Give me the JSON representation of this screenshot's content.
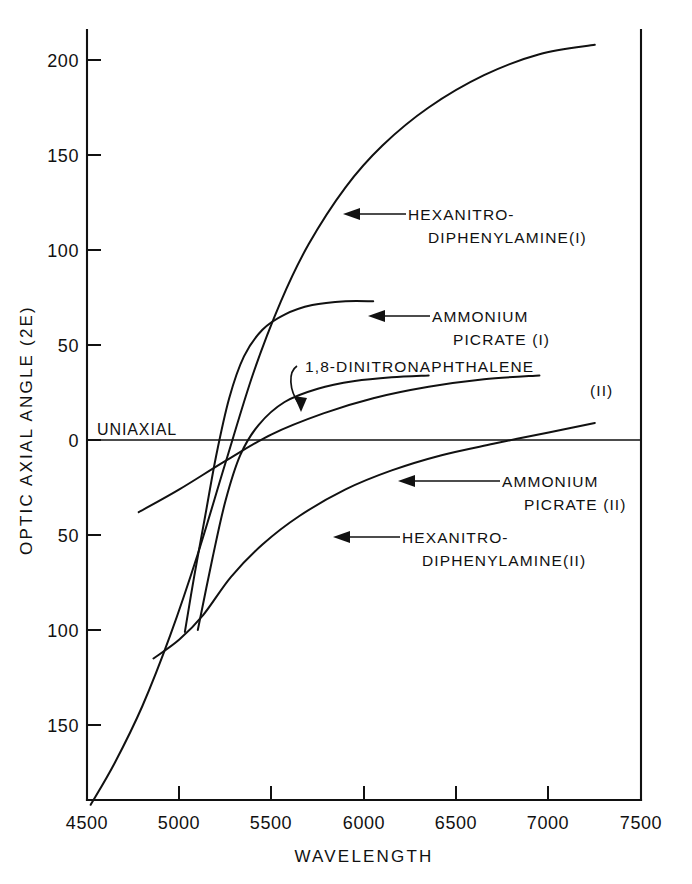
{
  "chart_data": {
    "type": "line",
    "title": "",
    "xlabel": "WAVELENGTH",
    "ylabel": "OPTIC AXIAL ANGLE (2E)",
    "xlim": [
      4500,
      7500
    ],
    "ylim": [
      -200,
      215
    ],
    "grid": false,
    "legend_position": "inline-annotations",
    "x_ticks": [
      "4500",
      "5000",
      "5500",
      "6000",
      "6500",
      "7000",
      "7500"
    ],
    "x_tick_values": [
      4500,
      5000,
      5500,
      6000,
      6500,
      7000,
      7500
    ],
    "y_ticks": [
      "200",
      "150",
      "100",
      "50",
      "0",
      "50",
      "100",
      "150"
    ],
    "y_tick_values": [
      200,
      150,
      100,
      50,
      0,
      -50,
      -100,
      -150
    ],
    "zero_annotation": "UNIAXIAL",
    "series": [
      {
        "name": "HEXANITRO-DIPHENYLAMINE(I)",
        "label_line1": "HEXANITRO-",
        "label_line2": "DIPHENYLAMINE(I)",
        "points": [
          [
            4520,
            -192
          ],
          [
            4650,
            -170
          ],
          [
            4800,
            -140
          ],
          [
            4950,
            -103
          ],
          [
            5100,
            -60
          ],
          [
            5250,
            -12
          ],
          [
            5400,
            35
          ],
          [
            5550,
            73
          ],
          [
            5700,
            103
          ],
          [
            5900,
            133
          ],
          [
            6100,
            155
          ],
          [
            6350,
            175
          ],
          [
            6650,
            192
          ],
          [
            6950,
            203
          ],
          [
            7250,
            208
          ]
        ]
      },
      {
        "name": "AMMONIUM PICRATE (I)",
        "label_line1": "AMMONIUM",
        "label_line2": "PICRATE (I)",
        "points": [
          [
            5030,
            -101
          ],
          [
            5080,
            -72
          ],
          [
            5140,
            -40
          ],
          [
            5200,
            -8
          ],
          [
            5270,
            22
          ],
          [
            5350,
            44
          ],
          [
            5450,
            58
          ],
          [
            5570,
            66
          ],
          [
            5720,
            71
          ],
          [
            5900,
            73
          ],
          [
            6050,
            73
          ]
        ]
      },
      {
        "name": "1,8-DINITRONAPHTHALENE (II)",
        "label_line1": "1,8-DINITRONAPHTHALENE",
        "label_line2": "(II)",
        "points": [
          [
            5100,
            -100
          ],
          [
            5180,
            -62
          ],
          [
            5250,
            -32
          ],
          [
            5330,
            -8
          ],
          [
            5430,
            8
          ],
          [
            5570,
            20
          ],
          [
            5750,
            27
          ],
          [
            5950,
            31
          ],
          [
            6150,
            33
          ],
          [
            6350,
            34
          ]
        ]
      },
      {
        "name": "AMMONIUM PICRATE (II)",
        "label_line1": "AMMONIUM",
        "label_line2": "PICRATE (II)",
        "points": [
          [
            4780,
            -38
          ],
          [
            5000,
            -26
          ],
          [
            5250,
            -11
          ],
          [
            5500,
            3
          ],
          [
            5780,
            14
          ],
          [
            6050,
            22
          ],
          [
            6350,
            28
          ],
          [
            6650,
            32
          ],
          [
            6950,
            34
          ]
        ]
      },
      {
        "name": "HEXANITRO-DIPHENYLAMINE(II)",
        "label_line1": "HEXANITRO-",
        "label_line2": "DIPHENYLAMINE(II)",
        "points": [
          [
            4860,
            -115
          ],
          [
            5000,
            -105
          ],
          [
            5130,
            -92
          ],
          [
            5280,
            -72
          ],
          [
            5450,
            -55
          ],
          [
            5650,
            -40
          ],
          [
            5900,
            -26
          ],
          [
            6150,
            -16
          ],
          [
            6420,
            -8
          ],
          [
            6700,
            -2
          ],
          [
            7000,
            4
          ],
          [
            7250,
            9
          ]
        ]
      }
    ],
    "annotations": [
      {
        "text": "UNIAXIAL",
        "x": 4560,
        "y": 6
      },
      {
        "text": "HEXANITRO-DIPHENYLAMINE(I)",
        "x": 5780,
        "y": 118
      },
      {
        "text": "AMMONIUM PICRATE (I)",
        "x": 5790,
        "y": 63
      },
      {
        "text": "1,8-DINITRONAPHTHALENE (II)",
        "x": 5380,
        "y": 33
      },
      {
        "text": "AMMONIUM PICRATE (II)",
        "x": 6020,
        "y": -24
      },
      {
        "text": "HEXANITRO-DIPHENYLAMINE(II)",
        "x": 5940,
        "y": -53
      }
    ]
  },
  "axis": {
    "x_title": "WAVELENGTH",
    "y_title": "OPTIC AXIAL ANGLE (2E)"
  },
  "ticks": {
    "x": [
      "4500",
      "5000",
      "5500",
      "6000",
      "6500",
      "7000",
      "7500"
    ],
    "y": [
      "200",
      "150",
      "100",
      "50",
      "0",
      "50",
      "100",
      "150"
    ]
  },
  "labels": {
    "uniaxial": "UNIAXIAL",
    "hnd1_line1": "HEXANITRO-",
    "hnd1_line2": "DIPHENYLAMINE(I)",
    "ap1_line1": "AMMONIUM",
    "ap1_line2": "PICRATE (I)",
    "dnn_line1": "1,8-DINITRONAPHTHALENE",
    "dnn_line2": "(II)",
    "ap2_line1": "AMMONIUM",
    "ap2_line2": "PICRATE (II)",
    "hnd2_line1": "HEXANITRO-",
    "hnd2_line2": "DIPHENYLAMINE(II)"
  },
  "colors": {
    "ink": "#111111",
    "paper": "#ffffff"
  }
}
